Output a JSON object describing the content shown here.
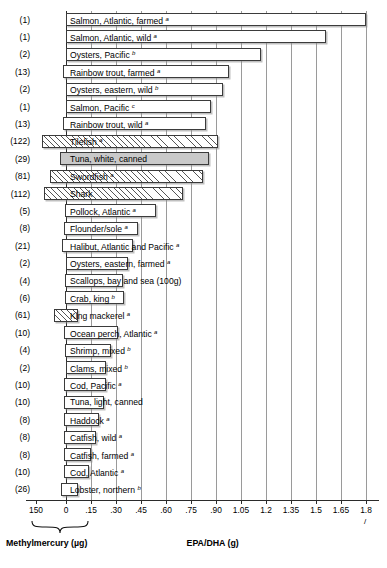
{
  "chart_data": {
    "type": "bar",
    "title": "",
    "orientation": "horizontal",
    "note": "Diverging horizontal bar chart: bars extend left from zero for methylmercury (ug) and right from zero for EPA/DHA (g).",
    "xlabel_left": "Methylmercury (µg)",
    "xlabel_right": "EPA/DHA (g)",
    "right_axis": {
      "ticks": [
        0,
        0.15,
        0.3,
        0.45,
        0.6,
        0.75,
        0.9,
        1.05,
        1.2,
        1.35,
        1.5,
        1.65,
        1.8
      ],
      "tick_labels": [
        "0",
        ".15",
        ".30",
        ".45",
        ".60",
        ".75",
        ".90",
        "1.05",
        "1.2",
        "1.35",
        "1.5",
        "1.65",
        "1.8"
      ],
      "range": [
        0,
        1.8
      ],
      "unit": "g"
    },
    "left_axis": {
      "ticks": [
        150,
        0
      ],
      "tick_labels": [
        "150",
        "0"
      ],
      "range": [
        150,
        0
      ],
      "unit": "µg"
    },
    "grid": "vertical gridlines at each right-axis tick",
    "legend": null,
    "axis_break_marker": "/",
    "categories": [
      {
        "label": "Salmon, Atlantic, farmed",
        "sup": "a",
        "count": "(1)",
        "epa_dha": 1.8,
        "methylmercury": 1,
        "style": "open"
      },
      {
        "label": "Salmon, Atlantic, wild",
        "sup": "a",
        "count": "(1)",
        "epa_dha": 1.56,
        "methylmercury": 1,
        "style": "open"
      },
      {
        "label": "Oysters, Pacific",
        "sup": "b",
        "count": "(2)",
        "epa_dha": 1.17,
        "methylmercury": 2,
        "style": "open"
      },
      {
        "label": "Rainbow trout, farmed",
        "sup": "a",
        "count": "(13)",
        "epa_dha": 0.98,
        "methylmercury": 13,
        "style": "open"
      },
      {
        "label": "Oysters, eastern, wild",
        "sup": "b",
        "count": "(2)",
        "epa_dha": 0.94,
        "methylmercury": 2,
        "style": "open"
      },
      {
        "label": "Salmon, Pacific",
        "sup": "c",
        "count": "(1)",
        "epa_dha": 0.87,
        "methylmercury": 1,
        "style": "open"
      },
      {
        "label": "Rainbow trout, wild",
        "sup": "a",
        "count": "(13)",
        "epa_dha": 0.84,
        "methylmercury": 13,
        "style": "open"
      },
      {
        "label": "Tilefish",
        "sup": "a",
        "count": "(122)",
        "epa_dha": 0.91,
        "methylmercury": 122,
        "style": "hatch"
      },
      {
        "label": "Tuna, white, canned",
        "sup": "",
        "count": "(29)",
        "epa_dha": 0.86,
        "methylmercury": 29,
        "style": "solid"
      },
      {
        "label": "Swordfish",
        "sup": "a",
        "count": "(81)",
        "epa_dha": 0.82,
        "methylmercury": 81,
        "style": "hatch"
      },
      {
        "label": "Shark",
        "sup": "",
        "count": "(112)",
        "epa_dha": 0.7,
        "methylmercury": 112,
        "style": "hatch"
      },
      {
        "label": "Pollock, Atlantic",
        "sup": "a",
        "count": "(5)",
        "epa_dha": 0.54,
        "methylmercury": 5,
        "style": "open"
      },
      {
        "label": "Flounder/sole",
        "sup": "a",
        "count": "(8)",
        "epa_dha": 0.43,
        "methylmercury": 8,
        "style": "open"
      },
      {
        "label": "Halibut, Atlantic and Pacific",
        "sup": "a",
        "count": "(21)",
        "epa_dha": 0.4,
        "methylmercury": 21,
        "style": "open"
      },
      {
        "label": "Oysters, eastern, farmed",
        "sup": "a",
        "count": "(2)",
        "epa_dha": 0.37,
        "methylmercury": 2,
        "style": "open"
      },
      {
        "label": "Scallops, bay and sea (100g)",
        "sup": "",
        "count": "(4)",
        "epa_dha": 0.34,
        "methylmercury": 4,
        "style": "open"
      },
      {
        "label": "Crab, king",
        "sup": "b",
        "count": "(6)",
        "epa_dha": 0.35,
        "methylmercury": 6,
        "style": "open"
      },
      {
        "label": "King mackerel",
        "sup": "a",
        "count": "(61)",
        "epa_dha": 0.07,
        "methylmercury": 61,
        "style": "hatch"
      },
      {
        "label": "Ocean perch, Atlantic",
        "sup": "a",
        "count": "(10)",
        "epa_dha": 0.31,
        "methylmercury": 10,
        "style": "open"
      },
      {
        "label": "Shrimp, mixed",
        "sup": "b",
        "count": "(4)",
        "epa_dha": 0.27,
        "methylmercury": 4,
        "style": "open"
      },
      {
        "label": "Clams, mixed",
        "sup": "b",
        "count": "(2)",
        "epa_dha": 0.24,
        "methylmercury": 2,
        "style": "open"
      },
      {
        "label": "Cod, Pacific",
        "sup": "a",
        "count": "(10)",
        "epa_dha": 0.24,
        "methylmercury": 10,
        "style": "open"
      },
      {
        "label": "Tuna, light, canned",
        "sup": "",
        "count": "(10)",
        "epa_dha": 0.23,
        "methylmercury": 10,
        "style": "open"
      },
      {
        "label": "Haddock",
        "sup": "a",
        "count": "(8)",
        "epa_dha": 0.2,
        "methylmercury": 8,
        "style": "open"
      },
      {
        "label": "Catfish, wild",
        "sup": "a",
        "count": "(8)",
        "epa_dha": 0.18,
        "methylmercury": 8,
        "style": "open"
      },
      {
        "label": "Catfish, farmed",
        "sup": "a",
        "count": "(8)",
        "epa_dha": 0.15,
        "methylmercury": 8,
        "style": "open"
      },
      {
        "label": "Cod, Atlantic",
        "sup": "a",
        "count": "(10)",
        "epa_dha": 0.14,
        "methylmercury": 10,
        "style": "open"
      },
      {
        "label": "Lobster, northern",
        "sup": "b",
        "count": "(26)",
        "epa_dha": 0.07,
        "methylmercury": 26,
        "style": "open"
      }
    ]
  },
  "colors": {
    "bar_outline": "#3b3b3b",
    "bar_fill_open": "#ffffff",
    "bar_fill_solid": "#c9c9c9",
    "gridline": "#9a9a9a",
    "axis": "#2b2b2b",
    "text": "#000000"
  }
}
